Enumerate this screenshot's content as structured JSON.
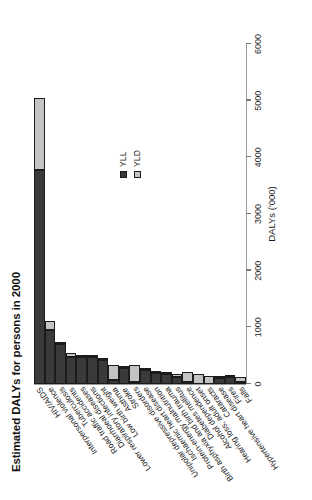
{
  "chart_data": {
    "type": "bar",
    "title": "Estimated DALYs for persons in 2000",
    "xlabel": "DALYs ('000)",
    "ylabel": "",
    "orientation": "horizontal",
    "stacked": true,
    "grid": false,
    "legend_position": "right-middle",
    "xlim": [
      0,
      6000
    ],
    "xticks": [
      0,
      1000,
      2000,
      3000,
      4000,
      5000,
      6000
    ],
    "xtick_labels": [
      "0",
      "1000",
      "2000",
      "3000",
      "4000",
      "5000",
      "6000"
    ],
    "categories": [
      "HIV/AIDS",
      "Interpersonal violence",
      "Tuberculosis",
      "Road traffic accidents",
      "Diarrhoeal diseases",
      "Lower respiratory infections",
      "Low birth weight",
      "Asthma",
      "Stroke",
      "Unipolar depressive disorders",
      "Ischaemic heart disease",
      "Protein-energy malnutrition",
      "Birth asphyxia and birth trauma",
      "Diabetes mellitus",
      "Alcohol dependence",
      "Hearing loss, adult onset",
      "Cataracts",
      "Hypertensive heart disease",
      "Fires",
      "Falls"
    ],
    "series": [
      {
        "name": "YLL",
        "color": "#3a3a3a",
        "values": [
          3780,
          960,
          700,
          480,
          480,
          470,
          420,
          70,
          280,
          10,
          250,
          200,
          180,
          120,
          20,
          0,
          0,
          110,
          120,
          30
        ]
      },
      {
        "name": "YLD",
        "color": "#c4c4c4",
        "values": [
          1270,
          150,
          20,
          60,
          10,
          20,
          20,
          260,
          30,
          300,
          20,
          20,
          30,
          50,
          180,
          170,
          140,
          10,
          10,
          90
        ]
      }
    ],
    "totals": [
      5050,
      1110,
      720,
      540,
      490,
      490,
      440,
      330,
      310,
      310,
      270,
      220,
      210,
      170,
      200,
      170,
      140,
      120,
      130,
      120
    ],
    "legend": [
      "YLL",
      "YLD"
    ]
  },
  "legend": {
    "items": [
      {
        "label": "YLL",
        "color": "#3a3a3a"
      },
      {
        "label": "YLD",
        "color": "#c4c4c4"
      }
    ]
  }
}
